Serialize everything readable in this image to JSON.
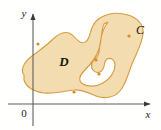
{
  "figure": {
    "kind": "green-theorem-region-diagram",
    "background_color": "#fffffd",
    "width": 161,
    "height": 130
  },
  "axes": {
    "origin_label": "0",
    "x_axis_label": "x",
    "y_axis_label": "y",
    "axis_color": "#5f5f63",
    "origin_x": 33,
    "origin_y": 104,
    "x_axis_end": 152,
    "y_axis_top": 12
  },
  "region": {
    "label": "D",
    "fill_color": "#f2dcb0",
    "stroke_color": "#d79b3f",
    "label_x": 64,
    "label_y": 66
  },
  "curve": {
    "label": "C",
    "label_x": 140,
    "label_y": 34,
    "orientation_marker_color": "#e08a22",
    "orientation_markers": [
      {
        "x": 38,
        "y": 44
      },
      {
        "x": 74,
        "y": 92
      },
      {
        "x": 99,
        "y": 74
      },
      {
        "x": 96,
        "y": 60
      },
      {
        "x": 129,
        "y": 36
      }
    ]
  }
}
